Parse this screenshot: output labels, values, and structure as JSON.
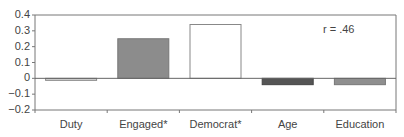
{
  "chart_data": {
    "type": "bar",
    "title": "",
    "xlabel": "",
    "ylabel": "",
    "categories": [
      "Duty",
      "Engaged*",
      "Democrat*",
      "Age",
      "Education"
    ],
    "values": [
      -0.01,
      0.25,
      0.34,
      -0.04,
      -0.04
    ],
    "bar_colors": [
      "#d8d8d8",
      "#8c8c8c",
      "#ffffff",
      "#555555",
      "#8f8f8f"
    ],
    "bar_borders": [
      "#888888",
      "#777777",
      "#888888",
      "#444444",
      "#777777"
    ],
    "ylim": [
      -0.2,
      0.4
    ],
    "yticks": [
      0.4,
      0.3,
      0.2,
      0.1,
      0,
      -0.1,
      -0.2
    ],
    "ytick_labels": [
      "0.4",
      "0.3",
      "0.2",
      "0.1",
      "0",
      "−0.1",
      "−0.2"
    ],
    "grid": false,
    "legend": null,
    "annotations": [
      {
        "text": "r = .46",
        "position": "upper-right"
      }
    ]
  },
  "annotation_text": "r = .46"
}
